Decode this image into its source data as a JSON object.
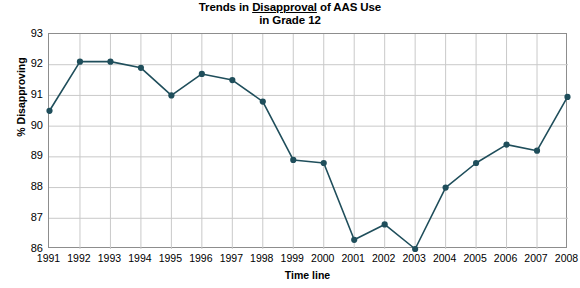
{
  "title": {
    "line1_pre": "Trends in ",
    "line1_underlined": "Disapproval",
    "line1_post": " of AAS Use",
    "line2": "in Grade 12"
  },
  "axes": {
    "y_title": "% Disapproving",
    "x_title": "Time line",
    "y_ticks": [
      "93",
      "92",
      "91",
      "90",
      "89",
      "88",
      "87",
      "86"
    ],
    "x_ticks": [
      "1991",
      "1992",
      "1993",
      "1994",
      "1995",
      "1996",
      "1997",
      "1998",
      "1999",
      "2000",
      "2001",
      "2002",
      "2003",
      "2004",
      "2005",
      "2006",
      "2007",
      "2008"
    ]
  },
  "colors": {
    "series": "#1f4e5b",
    "grid": "#c9c9c9",
    "axis_frame": "#8d8d8d",
    "background": "#ffffff",
    "text": "#000000"
  },
  "chart_data": {
    "type": "line",
    "title": "Trends in Disapproval of AAS Use in Grade 12",
    "xlabel": "Time line",
    "ylabel": "% Disapproving",
    "ylim": [
      86,
      93
    ],
    "xlim": [
      "1991",
      "2008"
    ],
    "grid": true,
    "legend": "none",
    "categories": [
      "1991",
      "1992",
      "1993",
      "1994",
      "1995",
      "1996",
      "1997",
      "1998",
      "1999",
      "2000",
      "2001",
      "2002",
      "2003",
      "2004",
      "2005",
      "2006",
      "2007",
      "2008"
    ],
    "series": [
      {
        "name": "% Disapproving",
        "marker": "filled-circle",
        "values": [
          90.5,
          92.1,
          92.1,
          91.9,
          91.0,
          91.7,
          91.5,
          90.8,
          88.9,
          88.8,
          86.3,
          86.8,
          86.0,
          88.0,
          88.8,
          89.4,
          89.2,
          90.95
        ]
      }
    ]
  }
}
